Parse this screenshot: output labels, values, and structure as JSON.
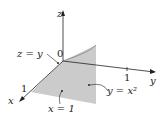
{
  "diagram": {
    "axes": {
      "z": "z",
      "y": "y",
      "x": "x"
    },
    "origin": "0",
    "ticks": {
      "x_one": "1",
      "y_one": "1"
    },
    "labels": {
      "plane_zy": "z = y",
      "curve": "y = x²",
      "plane_x": "x = 1"
    },
    "colors": {
      "fill": "#c8c8c8",
      "line": "#222222"
    }
  }
}
